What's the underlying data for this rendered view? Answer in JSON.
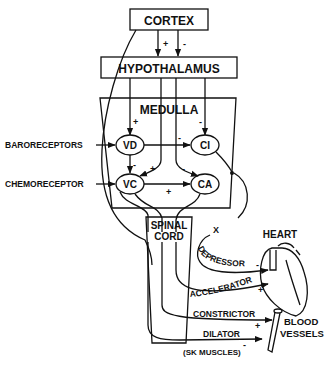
{
  "diagram": {
    "boxes": {
      "cortex": "CORTEX",
      "hypothalamus": "HYPOTHALAMUS",
      "medulla": "MEDULLA",
      "spinal_cord_line1": "SPINAL",
      "spinal_cord_line2": "CORD"
    },
    "centers": {
      "vd": "VD",
      "ci": "CI",
      "vc": "VC",
      "ca": "CA"
    },
    "inputs": {
      "baroreceptors": "BARORECEPTORS",
      "chemoreceptor": "CHEMORECEPTOR"
    },
    "nerves": {
      "depressor": "DEPRESSOR",
      "accelerator": "ACCELERATOR",
      "constrictor": "CONSTRICTOR",
      "dilator": "DILATOR"
    },
    "targets": {
      "heart": "HEART",
      "blood_line1": "BLOOD",
      "blood_line2": "VESSELS",
      "sk_muscles": "(SK MUSCLES)"
    },
    "signs": {
      "cortex_hyp_plus": "+",
      "cortex_hyp_minus": "-",
      "to_vd": "+",
      "to_ci": "-",
      "vd_ci": "-",
      "vd_vc": "-",
      "to_vc": "+",
      "to_ca": "-",
      "vc_ca": "+",
      "depressor": "-",
      "accelerator": "+",
      "constrictor": "+",
      "dilator": "-"
    },
    "vagus_marker": "X"
  }
}
